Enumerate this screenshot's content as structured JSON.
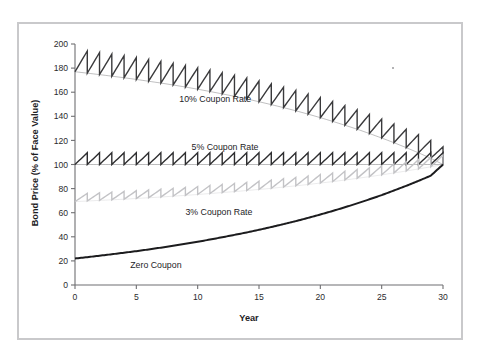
{
  "figure": {
    "frame_color": "#c9c9cb",
    "background": "#ffffff"
  },
  "axes": {
    "x_label": "Year",
    "y_label": "Bond Price (% of Face Value)",
    "x_ticks": [
      0,
      5,
      10,
      15,
      20,
      25,
      30
    ],
    "y_ticks": [
      0,
      20,
      40,
      60,
      80,
      100,
      120,
      140,
      160,
      180,
      200
    ],
    "x_tick_labels": [
      "0",
      "5",
      "10",
      "15",
      "20",
      "25",
      "30"
    ],
    "y_tick_labels": [
      "0",
      "20",
      "40",
      "60",
      "80",
      "100",
      "120",
      "140",
      "160",
      "180",
      "200"
    ],
    "axis_color": "#6f6f72"
  },
  "labels": {
    "coupon_10": "10% Coupon Rate",
    "coupon_5": "5% Coupon Rate",
    "coupon_3": "3% Coupon Rate",
    "zero_coupon": "Zero Coupon"
  },
  "chart_data": {
    "type": "line",
    "title": "",
    "xlabel": "Year",
    "ylabel": "Bond Price (% of Face Value)",
    "xlim": [
      0,
      30
    ],
    "ylim": [
      0,
      200
    ],
    "xticks": [
      0,
      5,
      10,
      15,
      20,
      25,
      30
    ],
    "yticks": [
      0,
      20,
      40,
      60,
      80,
      100,
      120,
      140,
      160,
      180,
      200
    ],
    "grid": false,
    "legend": "inline-annotations",
    "yield_to_maturity_pct": 5,
    "maturity_years": 30,
    "face_value": 100,
    "series": [
      {
        "name": "10% Coupon Rate",
        "coupon_rate_pct": 10,
        "color": "#3a3a3c",
        "line_width": 1.4,
        "sawtooth": true,
        "label_x": 8.5,
        "label_y": 152,
        "values": [
          {
            "x": 0,
            "y": 177
          },
          {
            "x": 1,
            "y": 175.8
          },
          {
            "x": 2,
            "y": 174.6
          },
          {
            "x": 3,
            "y": 173.3
          },
          {
            "x": 4,
            "y": 172.0
          },
          {
            "x": 5,
            "y": 170.6
          },
          {
            "x": 6,
            "y": 169.1
          },
          {
            "x": 7,
            "y": 167.6
          },
          {
            "x": 8,
            "y": 166.0
          },
          {
            "x": 9,
            "y": 164.3
          },
          {
            "x": 10,
            "y": 162.5
          },
          {
            "x": 11,
            "y": 160.6
          },
          {
            "x": 12,
            "y": 158.6
          },
          {
            "x": 13,
            "y": 156.6
          },
          {
            "x": 14,
            "y": 154.4
          },
          {
            "x": 15,
            "y": 152.1
          },
          {
            "x": 16,
            "y": 149.7
          },
          {
            "x": 17,
            "y": 147.2
          },
          {
            "x": 18,
            "y": 144.6
          },
          {
            "x": 19,
            "y": 141.8
          },
          {
            "x": 20,
            "y": 138.9
          },
          {
            "x": 21,
            "y": 135.8
          },
          {
            "x": 22,
            "y": 132.6
          },
          {
            "x": 23,
            "y": 129.3
          },
          {
            "x": 24,
            "y": 125.7
          },
          {
            "x": 25,
            "y": 122.0
          },
          {
            "x": 26,
            "y": 118.1
          },
          {
            "x": 27,
            "y": 114.0
          },
          {
            "x": 28,
            "y": 109.7
          },
          {
            "x": 29,
            "y": 105.2
          },
          {
            "x": 30,
            "y": 100.0
          }
        ]
      },
      {
        "name": "5% Coupon Rate",
        "coupon_rate_pct": 5,
        "color": "#2e2e30",
        "line_width": 1.4,
        "sawtooth": true,
        "label_x": 9.5,
        "label_y": 112,
        "values": [
          {
            "x": 0,
            "y": 100
          },
          {
            "x": 5,
            "y": 100
          },
          {
            "x": 10,
            "y": 100
          },
          {
            "x": 15,
            "y": 100
          },
          {
            "x": 20,
            "y": 100
          },
          {
            "x": 25,
            "y": 100
          },
          {
            "x": 30,
            "y": 100
          }
        ]
      },
      {
        "name": "3% Coupon Rate",
        "coupon_rate_pct": 3,
        "color": "#c3c3c6",
        "line_width": 1.4,
        "sawtooth": true,
        "label_x": 9.0,
        "label_y": 58,
        "values": [
          {
            "x": 0,
            "y": 69.2
          },
          {
            "x": 1,
            "y": 69.7
          },
          {
            "x": 2,
            "y": 70.2
          },
          {
            "x": 3,
            "y": 70.7
          },
          {
            "x": 4,
            "y": 71.2
          },
          {
            "x": 5,
            "y": 71.8
          },
          {
            "x": 6,
            "y": 72.4
          },
          {
            "x": 7,
            "y": 73.0
          },
          {
            "x": 8,
            "y": 73.7
          },
          {
            "x": 9,
            "y": 74.4
          },
          {
            "x": 10,
            "y": 75.1
          },
          {
            "x": 11,
            "y": 75.9
          },
          {
            "x": 12,
            "y": 76.7
          },
          {
            "x": 13,
            "y": 77.5
          },
          {
            "x": 14,
            "y": 78.4
          },
          {
            "x": 15,
            "y": 79.3
          },
          {
            "x": 16,
            "y": 80.2
          },
          {
            "x": 17,
            "y": 81.3
          },
          {
            "x": 18,
            "y": 82.3
          },
          {
            "x": 19,
            "y": 83.4
          },
          {
            "x": 20,
            "y": 84.6
          },
          {
            "x": 21,
            "y": 85.8
          },
          {
            "x": 22,
            "y": 87.1
          },
          {
            "x": 23,
            "y": 88.5
          },
          {
            "x": 24,
            "y": 89.9
          },
          {
            "x": 25,
            "y": 91.4
          },
          {
            "x": 26,
            "y": 93.0
          },
          {
            "x": 27,
            "y": 94.6
          },
          {
            "x": 28,
            "y": 96.3
          },
          {
            "x": 29,
            "y": 98.1
          },
          {
            "x": 30,
            "y": 100.0
          }
        ]
      },
      {
        "name": "Zero Coupon",
        "coupon_rate_pct": 0,
        "color": "#1c1c1e",
        "line_width": 2.0,
        "sawtooth": false,
        "label_x": 4.5,
        "label_y": 14,
        "values": [
          {
            "x": 0,
            "y": 22.0
          },
          {
            "x": 1,
            "y": 23.1
          },
          {
            "x": 2,
            "y": 24.3
          },
          {
            "x": 3,
            "y": 25.5
          },
          {
            "x": 4,
            "y": 26.8
          },
          {
            "x": 5,
            "y": 28.1
          },
          {
            "x": 6,
            "y": 29.5
          },
          {
            "x": 7,
            "y": 31.0
          },
          {
            "x": 8,
            "y": 32.6
          },
          {
            "x": 9,
            "y": 34.2
          },
          {
            "x": 10,
            "y": 35.9
          },
          {
            "x": 11,
            "y": 37.7
          },
          {
            "x": 12,
            "y": 39.6
          },
          {
            "x": 13,
            "y": 41.6
          },
          {
            "x": 14,
            "y": 43.6
          },
          {
            "x": 15,
            "y": 45.8
          },
          {
            "x": 16,
            "y": 48.1
          },
          {
            "x": 17,
            "y": 50.5
          },
          {
            "x": 18,
            "y": 53.0
          },
          {
            "x": 19,
            "y": 55.7
          },
          {
            "x": 20,
            "y": 58.5
          },
          {
            "x": 21,
            "y": 61.4
          },
          {
            "x": 22,
            "y": 64.5
          },
          {
            "x": 23,
            "y": 67.7
          },
          {
            "x": 24,
            "y": 71.1
          },
          {
            "x": 25,
            "y": 74.6
          },
          {
            "x": 26,
            "y": 78.4
          },
          {
            "x": 27,
            "y": 82.3
          },
          {
            "x": 28,
            "y": 86.4
          },
          {
            "x": 29,
            "y": 90.7
          },
          {
            "x": 30,
            "y": 100.0
          }
        ]
      }
    ]
  }
}
